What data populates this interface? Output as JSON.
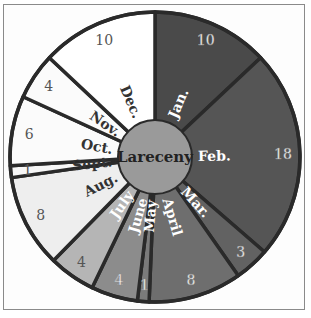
{
  "chart_data": {
    "type": "pie",
    "title": "Lareceny",
    "center_label": "Lareceny",
    "categories": [
      "Jan.",
      "Feb.",
      "Mar.",
      "April",
      "May",
      "June",
      "July",
      "Aug.",
      "Sept.",
      "Oct.",
      "Nov.",
      "Dec."
    ],
    "values": [
      10,
      18,
      3,
      8,
      1,
      4,
      4,
      8,
      1,
      6,
      4,
      10
    ],
    "value_labels": [
      "10",
      "18",
      "3",
      "8",
      "1",
      "4",
      "4",
      "8",
      "1",
      "6",
      "4",
      "10"
    ],
    "colors": [
      "#4a4a4a",
      "#555555",
      "#626262",
      "#6e6e6e",
      "#7b7b7b",
      "#8c8c8c",
      "#b5b5b5",
      "#eeeeee",
      "#f7f7f7",
      "#fbfbfb",
      "#fbfbfb",
      "#ffffff"
    ],
    "month_label_colors": [
      "#ffffff",
      "#ffffff",
      "#ffffff",
      "#ffffff",
      "#ffffff",
      "#ffffff",
      "#ffffff",
      "#333333",
      "#333333",
      "#333333",
      "#333333",
      "#333333"
    ],
    "value_label_colors": [
      "#ffffff",
      "#ffffff",
      "#ffffff",
      "#ffffff",
      "#ffffff",
      "#ffffff",
      "#555555",
      "#555555",
      "#555555",
      "#555555",
      "#555555",
      "#555555"
    ],
    "center_color": "#9a9a9a",
    "stroke_color": "#2a2a2a",
    "start_angle_deg": 0,
    "direction": "clockwise",
    "legend": "none",
    "grid": false
  }
}
